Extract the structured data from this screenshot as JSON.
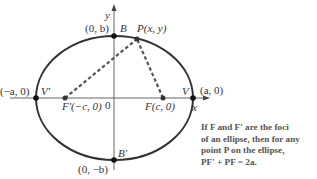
{
  "diagram": {
    "type": "ellipse-foci",
    "axes": {
      "x_label": "x",
      "y_label": "y",
      "origin_label": "0"
    },
    "points": {
      "B": {
        "name": "B",
        "coord": "(0, b)"
      },
      "B_prime": {
        "name": "B'",
        "coord": "(0, −b)"
      },
      "V": {
        "name": "V",
        "coord": "(a, 0)"
      },
      "V_prime": {
        "name": "V'",
        "coord": "(−a, 0)"
      },
      "F": {
        "name": "F(c, 0)"
      },
      "F_prime": {
        "name": "F'(−c, 0)"
      },
      "P": {
        "name": "P(x, y)"
      }
    },
    "caption": {
      "line1": "If F and F' are the foci",
      "line2": "of an ellipse, then for any",
      "line3": "point P on the ellipse,",
      "line4": "PF' + PF = 2a."
    },
    "colors": {
      "curve": "#333333",
      "axis": "#555555",
      "dashes": "#555555"
    }
  }
}
